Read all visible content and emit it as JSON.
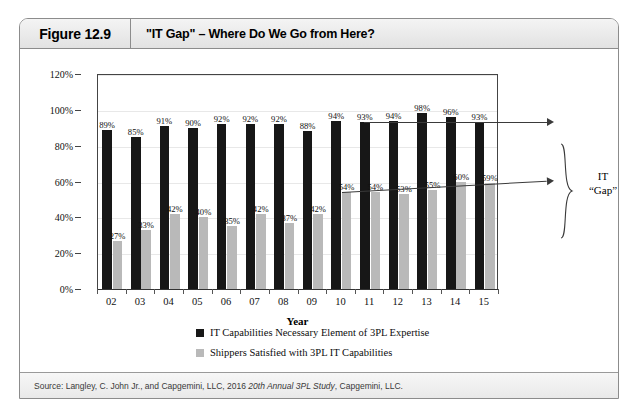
{
  "figure": {
    "number": "Figure 12.9",
    "title": "\"IT Gap\" – Where Do We Go from Here?",
    "source_prefix": "Source: Langley, C. John Jr., and Capgemini, LLC, 2016 ",
    "source_italic": "20th Annual 3PL Study",
    "source_suffix": ", Capgemini, LLC."
  },
  "annotation": {
    "gap_line1": "IT",
    "gap_line2": "“Gap”"
  },
  "colors": {
    "dark_series": "#171717",
    "light_series": "#b9b9b9",
    "axis": "#333333",
    "gridline": "#e8e8e8",
    "card_border": "#8c8c8c",
    "header_band": "#e8e8e8"
  },
  "chart_data": {
    "type": "bar",
    "title": "\"IT Gap\" – Where Do We Go from Here?",
    "xlabel": "Year",
    "ylabel": "",
    "ylim": [
      0,
      120
    ],
    "ytick_labels": [
      "0%",
      "20%",
      "40%",
      "60%",
      "80%",
      "100%",
      "120%"
    ],
    "ytick_values": [
      0,
      20,
      40,
      60,
      80,
      100,
      120
    ],
    "grid": true,
    "legend_position": "bottom",
    "categories": [
      "02",
      "03",
      "04",
      "05",
      "06",
      "07",
      "08",
      "09",
      "10",
      "11",
      "12",
      "13",
      "14",
      "15"
    ],
    "series": [
      {
        "name": "IT Capabilities Necessary Element of 3PL Expertise",
        "color": "#171717",
        "values": [
          89,
          85,
          91,
          90,
          92,
          92,
          92,
          88,
          94,
          93,
          94,
          98,
          96,
          93
        ],
        "labels": [
          "89%",
          "85%",
          "91%",
          "90%",
          "92%",
          "92%",
          "92%",
          "88%",
          "94%",
          "93%",
          "94%",
          "98%",
          "96%",
          "93%"
        ]
      },
      {
        "name": "Shippers Satisfied with 3PL IT Capabilities",
        "color": "#b9b9b9",
        "values": [
          27,
          33,
          42,
          40,
          35,
          42,
          37,
          42,
          54,
          54,
          53,
          55,
          60,
          59
        ],
        "labels": [
          "27%",
          "33%",
          "42%",
          "40%",
          "35%",
          "42%",
          "37%",
          "42%",
          "54%",
          "54%",
          "53%",
          "55%",
          "60%",
          "59%"
        ]
      }
    ]
  }
}
